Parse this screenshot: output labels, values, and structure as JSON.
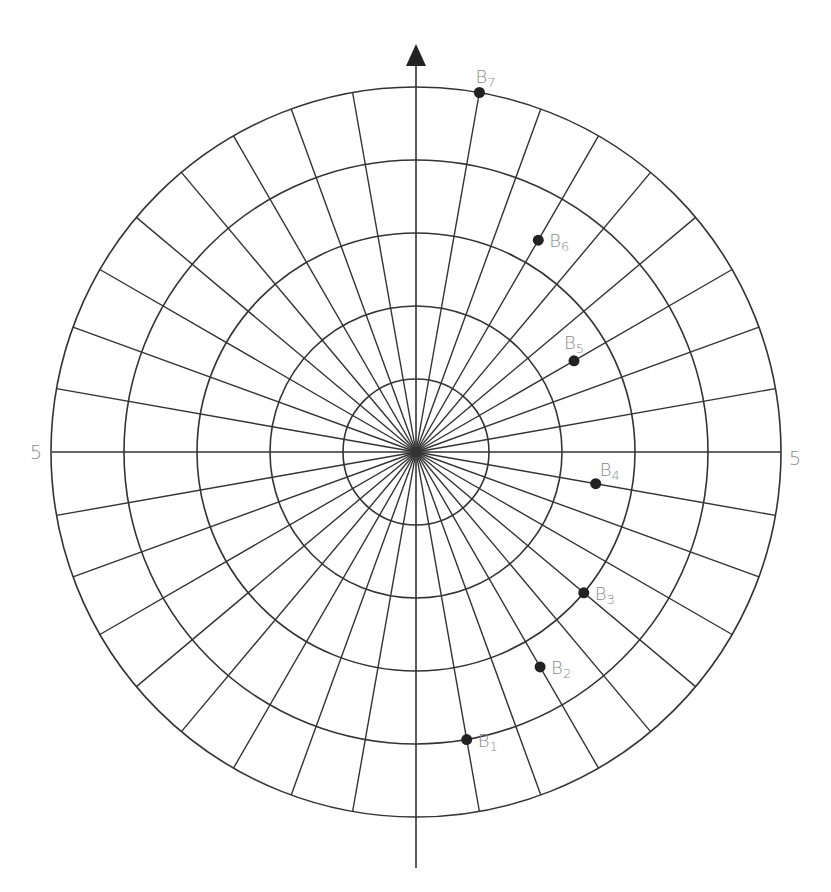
{
  "diagram": {
    "type": "polar-grid",
    "ring_count": 5,
    "radial_spacing_deg": 10,
    "colors": {
      "grid": "#333333",
      "marker": "#222222",
      "label": "#8a8a8a"
    },
    "axis_labels": {
      "left": "5",
      "right": "5"
    },
    "points": [
      {
        "name": "B",
        "sub": "1",
        "angle_deg": 170,
        "radius": 4.0
      },
      {
        "name": "B",
        "sub": "2",
        "angle_deg": 150,
        "radius": 3.4
      },
      {
        "name": "B",
        "sub": "3",
        "angle_deg": 130,
        "radius": 3.0
      },
      {
        "name": "B",
        "sub": "4",
        "angle_deg": 100,
        "radius": 2.5
      },
      {
        "name": "B",
        "sub": "5",
        "angle_deg": 60,
        "radius": 2.5
      },
      {
        "name": "B",
        "sub": "6",
        "angle_deg": 30,
        "radius": 3.35
      },
      {
        "name": "B",
        "sub": "7",
        "angle_deg": 10,
        "radius": 5.0
      }
    ]
  }
}
